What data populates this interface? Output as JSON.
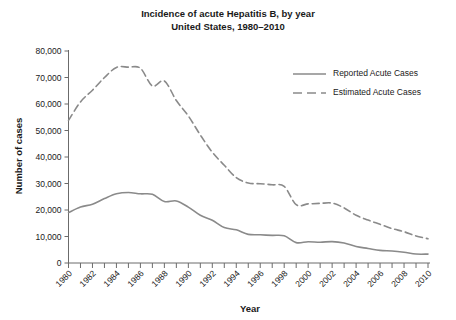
{
  "chart_data": {
    "type": "line",
    "title": "Incidence of acute Hepatitis B, by year",
    "subtitle": "United States, 1980–2010",
    "xlabel": "Year",
    "ylabel": "Number of cases",
    "xlim": [
      1980,
      2010
    ],
    "ylim": [
      0,
      80000
    ],
    "grid": false,
    "legend_position": "upper-right",
    "x": [
      1980,
      1981,
      1982,
      1983,
      1984,
      1985,
      1986,
      1987,
      1988,
      1989,
      1990,
      1991,
      1992,
      1993,
      1994,
      1995,
      1996,
      1997,
      1998,
      1999,
      2000,
      2001,
      2002,
      2003,
      2004,
      2005,
      2006,
      2007,
      2008,
      2009,
      2010
    ],
    "ytick_labels": [
      "0",
      "10,000",
      "20,000",
      "30,000",
      "40,000",
      "50,000",
      "60,000",
      "70,000",
      "80,000"
    ],
    "ytick_values": [
      0,
      10000,
      20000,
      30000,
      40000,
      50000,
      60000,
      70000,
      80000
    ],
    "xtick_labels": [
      "1980",
      "1982",
      "1984",
      "1986",
      "1988",
      "1990",
      "1992",
      "1994",
      "1996",
      "1998",
      "2000",
      "2002",
      "2004",
      "2006",
      "2008",
      "2010"
    ],
    "xtick_values": [
      1980,
      1982,
      1984,
      1986,
      1988,
      1990,
      1992,
      1994,
      1996,
      1998,
      2000,
      2002,
      2004,
      2006,
      2008,
      2010
    ],
    "series": [
      {
        "name": "Reported Acute Cases",
        "style": "solid",
        "color": "#8a8a8a",
        "values": [
          19015,
          21152,
          22177,
          24318,
          26115,
          26611,
          26107,
          25916,
          23177,
          23419,
          21102,
          18003,
          16126,
          13361,
          12517,
          10805,
          10637,
          10416,
          10258,
          7694,
          8036,
          7844,
          8064,
          7526,
          6212,
          5494,
          4758,
          4519,
          4033,
          3371,
          3350
        ]
      },
      {
        "name": "Estimated Acute Cases",
        "style": "dashed",
        "color": "#8a8a8a",
        "values": [
          53800,
          60800,
          65200,
          70000,
          73800,
          73900,
          73500,
          66800,
          68700,
          61300,
          55500,
          48300,
          41800,
          36900,
          32200,
          30200,
          29900,
          29500,
          28900,
          22000,
          22300,
          22500,
          22600,
          20800,
          18000,
          16200,
          14600,
          13000,
          11800,
          10200,
          9150
        ]
      }
    ]
  }
}
